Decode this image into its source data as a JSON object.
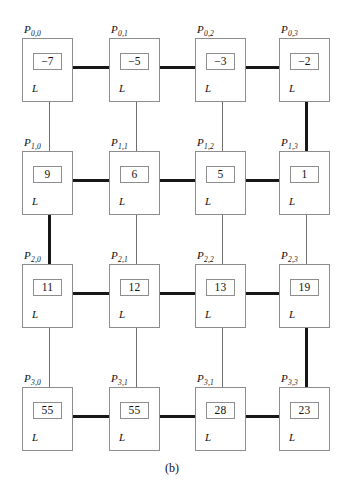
{
  "figure": {
    "caption": "(b)",
    "mode_letter": "L",
    "type": "mesh-connected-processor-array",
    "rows": 4,
    "cols": 4,
    "colors": {
      "thick_link": "#171717",
      "thin_link": "#6f6f6f",
      "box_border": "#8d8d8d",
      "background": "#ffffff",
      "text": "#111111"
    },
    "cells": [
      {
        "id": "P0,0",
        "row": 0,
        "col": 0,
        "label_main": "P",
        "label_sub": "0,0",
        "value": "−7",
        "mode": "L"
      },
      {
        "id": "P0,1",
        "row": 0,
        "col": 1,
        "label_main": "P",
        "label_sub": "0,1",
        "value": "−5",
        "mode": "L"
      },
      {
        "id": "P0,2",
        "row": 0,
        "col": 2,
        "label_main": "P",
        "label_sub": "0,2",
        "value": "−3",
        "mode": "L"
      },
      {
        "id": "P0,3",
        "row": 0,
        "col": 3,
        "label_main": "P",
        "label_sub": "0,3",
        "value": "−2",
        "mode": "L"
      },
      {
        "id": "P1,0",
        "row": 1,
        "col": 0,
        "label_main": "P",
        "label_sub": "1,0",
        "value": "9",
        "mode": "L"
      },
      {
        "id": "P1,1",
        "row": 1,
        "col": 1,
        "label_main": "P",
        "label_sub": "1,1",
        "value": "6",
        "mode": "L"
      },
      {
        "id": "P1,2",
        "row": 1,
        "col": 2,
        "label_main": "P",
        "label_sub": "1,2",
        "value": "5",
        "mode": "L"
      },
      {
        "id": "P1,3",
        "row": 1,
        "col": 3,
        "label_main": "P",
        "label_sub": "1,3",
        "value": "1",
        "mode": "L"
      },
      {
        "id": "P2,0",
        "row": 2,
        "col": 0,
        "label_main": "P",
        "label_sub": "2,0",
        "value": "11",
        "mode": "L"
      },
      {
        "id": "P2,1",
        "row": 2,
        "col": 1,
        "label_main": "P",
        "label_sub": "2,1",
        "value": "12",
        "mode": "L"
      },
      {
        "id": "P2,2",
        "row": 2,
        "col": 2,
        "label_main": "P",
        "label_sub": "2,2",
        "value": "13",
        "mode": "L"
      },
      {
        "id": "P2,3",
        "row": 2,
        "col": 3,
        "label_main": "P",
        "label_sub": "2,3",
        "value": "19",
        "mode": "L"
      },
      {
        "id": "P3,0",
        "row": 3,
        "col": 0,
        "label_main": "P",
        "label_sub": "3,0",
        "value": "55",
        "mode": "L"
      },
      {
        "id": "P3,1",
        "row": 3,
        "col": 1,
        "label_main": "P",
        "label_sub": "3,1",
        "value": "55",
        "mode": "L"
      },
      {
        "id": "P3,2",
        "row": 3,
        "col": 2,
        "label_main": "P",
        "label_sub": "3,1",
        "value": "28",
        "mode": "L"
      },
      {
        "id": "P3,3",
        "row": 3,
        "col": 3,
        "label_main": "P",
        "label_sub": "3,3",
        "value": "23",
        "mode": "L"
      }
    ],
    "horizontal_links": [
      {
        "row": 0,
        "from_col": 0,
        "to_col": 1,
        "weight": "thick"
      },
      {
        "row": 0,
        "from_col": 1,
        "to_col": 2,
        "weight": "thick"
      },
      {
        "row": 0,
        "from_col": 2,
        "to_col": 3,
        "weight": "thick"
      },
      {
        "row": 1,
        "from_col": 0,
        "to_col": 1,
        "weight": "thick"
      },
      {
        "row": 1,
        "from_col": 1,
        "to_col": 2,
        "weight": "thick"
      },
      {
        "row": 1,
        "from_col": 2,
        "to_col": 3,
        "weight": "thick"
      },
      {
        "row": 2,
        "from_col": 0,
        "to_col": 1,
        "weight": "thick"
      },
      {
        "row": 2,
        "from_col": 1,
        "to_col": 2,
        "weight": "thick"
      },
      {
        "row": 2,
        "from_col": 2,
        "to_col": 3,
        "weight": "thick"
      },
      {
        "row": 3,
        "from_col": 0,
        "to_col": 1,
        "weight": "thick"
      },
      {
        "row": 3,
        "from_col": 1,
        "to_col": 2,
        "weight": "thick"
      },
      {
        "row": 3,
        "from_col": 2,
        "to_col": 3,
        "weight": "thick"
      }
    ],
    "vertical_links": [
      {
        "col": 0,
        "from_row": 0,
        "to_row": 1,
        "weight": "thin"
      },
      {
        "col": 0,
        "from_row": 1,
        "to_row": 2,
        "weight": "thick"
      },
      {
        "col": 0,
        "from_row": 2,
        "to_row": 3,
        "weight": "thin"
      },
      {
        "col": 1,
        "from_row": 0,
        "to_row": 1,
        "weight": "thin"
      },
      {
        "col": 1,
        "from_row": 1,
        "to_row": 2,
        "weight": "thin"
      },
      {
        "col": 1,
        "from_row": 2,
        "to_row": 3,
        "weight": "thin"
      },
      {
        "col": 2,
        "from_row": 0,
        "to_row": 1,
        "weight": "thin"
      },
      {
        "col": 2,
        "from_row": 1,
        "to_row": 2,
        "weight": "thin"
      },
      {
        "col": 2,
        "from_row": 2,
        "to_row": 3,
        "weight": "thin"
      },
      {
        "col": 3,
        "from_row": 0,
        "to_row": 1,
        "weight": "thick"
      },
      {
        "col": 3,
        "from_row": 1,
        "to_row": 2,
        "weight": "thin"
      },
      {
        "col": 3,
        "from_row": 2,
        "to_row": 3,
        "weight": "thick"
      }
    ]
  },
  "geometry": {
    "col_x": [
      22,
      109,
      195,
      279
    ],
    "row_y": [
      38,
      151,
      264,
      387
    ],
    "cell_w": 51,
    "cell_h": 64,
    "hlink_y_offset": 29,
    "vlink_x_offset": 27,
    "thick_px": 3,
    "thin_px": 1,
    "label_dx": 2,
    "label_dy": -14
  }
}
